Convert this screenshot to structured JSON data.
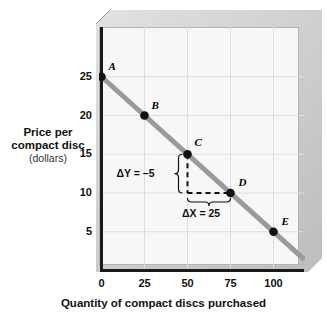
{
  "chart_data": {
    "type": "line",
    "title": "",
    "xlabel": "Quantity of compact discs purchased",
    "ylabel_lines": [
      "Price per",
      "compact disc",
      "(dollars)"
    ],
    "ylabel": "Price per compact disc (dollars)",
    "xlim": [
      0,
      120
    ],
    "ylim": [
      0,
      27
    ],
    "xticks": [
      0,
      25,
      50,
      75,
      100
    ],
    "xtick_labels": [
      "0",
      "25",
      "50",
      "75",
      "100"
    ],
    "yticks": [
      5,
      10,
      15,
      20,
      25
    ],
    "ytick_labels": [
      "5",
      "10",
      "15",
      "20",
      "25"
    ],
    "grid": true,
    "legend": "none",
    "series": [
      {
        "name": "Demand",
        "color": "#9a9a9a",
        "x": [
          0,
          25,
          50,
          75,
          100
        ],
        "values": [
          25,
          20,
          15,
          10,
          5
        ],
        "point_labels": [
          "A",
          "B",
          "C",
          "D",
          "E"
        ],
        "slope": -0.2
      }
    ],
    "annotations": [
      {
        "name": "delta-y",
        "text": "ΔY = –5",
        "symbol": "Δ",
        "var": "Y",
        "value": -5
      },
      {
        "name": "delta-x",
        "text": "ΔX = 25",
        "symbol": "Δ",
        "var": "X",
        "value": 25
      }
    ],
    "points": [
      {
        "label": "A",
        "x": 0,
        "y": 25
      },
      {
        "label": "B",
        "x": 25,
        "y": 20
      },
      {
        "label": "C",
        "x": 50,
        "y": 15
      },
      {
        "label": "D",
        "x": 75,
        "y": 10
      },
      {
        "label": "E",
        "x": 100,
        "y": 5
      }
    ]
  },
  "figure": {
    "line_color": "#9a9a9a",
    "point_color": "#111111",
    "plot_bg": "#f7f7f7",
    "frame_color": "#cfcfcf",
    "axis_color": "#1a1a1a",
    "grid_color": "#dedede"
  },
  "annotations": {
    "delta_y": "ΔY = –5",
    "delta_x": "ΔX = 25"
  },
  "axes": {
    "x_title": "Quantity of compact discs purchased",
    "y_title_1": "Price per",
    "y_title_2": "compact disc",
    "y_title_3": "(dollars)",
    "x_labels": [
      "0",
      "25",
      "50",
      "75",
      "100"
    ],
    "y_labels": [
      "25",
      "20",
      "15",
      "10",
      "5"
    ]
  },
  "point_labels": [
    "A",
    "B",
    "C",
    "D",
    "E"
  ]
}
